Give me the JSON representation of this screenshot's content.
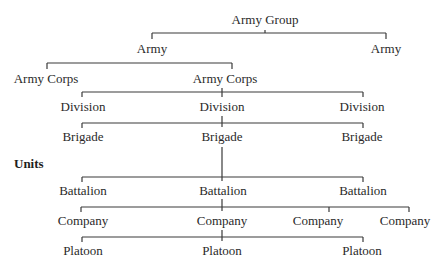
{
  "diagram": {
    "type": "hierarchy",
    "colors": {
      "text": "#2a2a2a",
      "lines": "#3a3a3a",
      "background": "#ffffff"
    },
    "section_heading": "Units",
    "levels": [
      {
        "level": "army_group",
        "nodes": [
          "Army Group"
        ]
      },
      {
        "level": "army",
        "nodes": [
          "Army",
          "Army"
        ]
      },
      {
        "level": "army_corps",
        "nodes": [
          "Army Corps",
          "Army Corps"
        ]
      },
      {
        "level": "division",
        "nodes": [
          "Division",
          "Division",
          "Division"
        ]
      },
      {
        "level": "brigade",
        "nodes": [
          "Brigade",
          "Brigade",
          "Brigade"
        ]
      },
      {
        "level": "battalion",
        "nodes": [
          "Battalion",
          "Battalion",
          "Battalion"
        ]
      },
      {
        "level": "company",
        "nodes": [
          "Company",
          "Company",
          "Company",
          "Company"
        ]
      },
      {
        "level": "platoon",
        "nodes": [
          "Platoon",
          "Platoon",
          "Platoon"
        ]
      }
    ],
    "edges": [
      {
        "from": "Army Group",
        "to": [
          "Army (left)",
          "Army (right)"
        ]
      },
      {
        "from": "Army (left)",
        "to": [
          "Army Corps (left)",
          "Army Corps (right)"
        ]
      },
      {
        "from": "Army Corps (right)",
        "to": [
          "Division 1",
          "Division 2",
          "Division 3"
        ]
      },
      {
        "from": "Division 2",
        "to": [
          "Brigade 1",
          "Brigade 2",
          "Brigade 3"
        ]
      },
      {
        "from": "Brigade 2",
        "to": [
          "Battalion 1",
          "Battalion 2",
          "Battalion 3"
        ]
      },
      {
        "from": "Battalion 2",
        "to": [
          "Company 1",
          "Company 2",
          "Company 3",
          "Company 4"
        ]
      },
      {
        "from": "Company 2",
        "to": [
          "Platoon 1",
          "Platoon 2",
          "Platoon 3"
        ]
      }
    ]
  }
}
